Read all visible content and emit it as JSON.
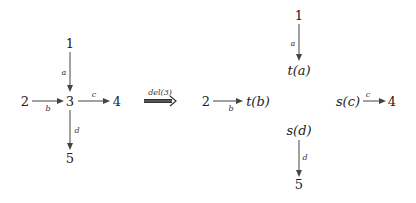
{
  "diagram": {
    "left": {
      "nodes": [
        {
          "id": "n1",
          "label": "1"
        },
        {
          "id": "n2",
          "label": "2"
        },
        {
          "id": "n3",
          "label": "3"
        },
        {
          "id": "n4",
          "label": "4"
        },
        {
          "id": "n5",
          "label": "5"
        }
      ],
      "edges": [
        {
          "from": "1",
          "to": "3",
          "label": "a"
        },
        {
          "from": "2",
          "to": "3",
          "label": "b"
        },
        {
          "from": "3",
          "to": "4",
          "label": "c"
        },
        {
          "from": "3",
          "to": "5",
          "label": "d"
        }
      ]
    },
    "transform": {
      "label": "del(3)"
    },
    "right": {
      "nodes": [
        {
          "id": "r1",
          "label": "1"
        },
        {
          "id": "ta",
          "label": "t(a)"
        },
        {
          "id": "r2",
          "label": "2"
        },
        {
          "id": "tb",
          "label": "t(b)"
        },
        {
          "id": "sc",
          "label": "s(c)"
        },
        {
          "id": "r4",
          "label": "4"
        },
        {
          "id": "sd",
          "label": "s(d)"
        },
        {
          "id": "r5",
          "label": "5"
        }
      ],
      "edges": [
        {
          "from": "1",
          "to": "t(a)",
          "label": "a"
        },
        {
          "from": "2",
          "to": "t(b)",
          "label": "b"
        },
        {
          "from": "s(c)",
          "to": "4",
          "label": "c"
        },
        {
          "from": "s(d)",
          "to": "5",
          "label": "d"
        }
      ]
    }
  }
}
